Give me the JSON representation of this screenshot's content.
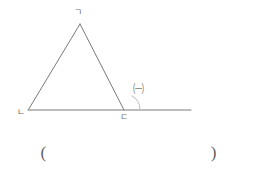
{
  "figure": {
    "type": "geometry-diagram",
    "stroke_color": "#7a7a7a",
    "arc_color": "#b9b9b9",
    "background_color": "#ffffff",
    "vertices": {
      "apex": {
        "label": "ㄱ",
        "x": 80,
        "y": 24
      },
      "bottom_left": {
        "label": "ㄴ",
        "x": 28,
        "y": 110
      },
      "bottom_right": {
        "label": "ㄷ",
        "x": 124,
        "y": 110
      }
    },
    "base_line": {
      "x1": 28,
      "y1": 110,
      "x2": 191,
      "y2": 110
    },
    "angle_mark": {
      "label": "㈠",
      "at_vertex": "ㄷ",
      "kind": "exterior-angle",
      "arc_radius": 16
    }
  },
  "answer": {
    "open_paren": "(",
    "close_paren": ")",
    "value": ""
  }
}
